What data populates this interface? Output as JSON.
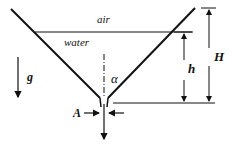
{
  "diagram": {
    "type": "funnel-drain",
    "labels": {
      "air": "air",
      "water": "water",
      "gravity": "g",
      "angle": "α",
      "area": "A",
      "water_height": "h",
      "total_height": "H"
    },
    "colors": {
      "line": "#111111",
      "background": "#ffffff"
    }
  }
}
